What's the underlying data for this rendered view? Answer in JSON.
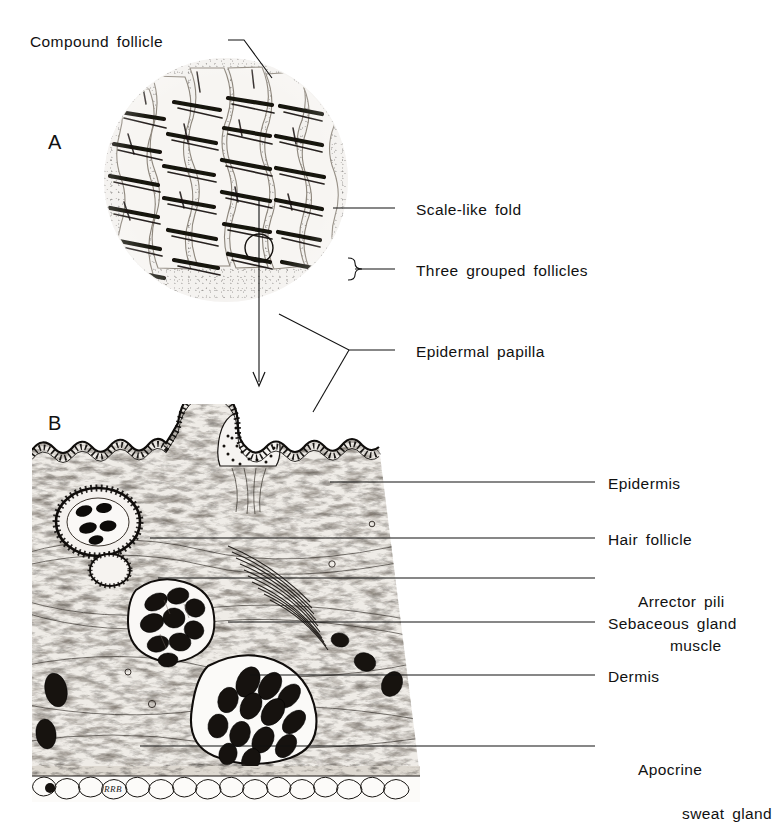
{
  "figure": {
    "panels": [
      {
        "id": "A",
        "letter": "A",
        "caption": "Surface view of haired skin showing scale-like folds and compound follicles"
      },
      {
        "id": "B",
        "letter": "B",
        "caption": "Vertical histologic section of haired skin"
      }
    ]
  },
  "labels": {
    "compound_follicle": "Compound follicle",
    "scale_like_fold": "Scale-like fold",
    "three_grouped_follicles": "Three grouped follicles",
    "epidermal_papilla": "Epidermal papilla",
    "epidermis": "Epidermis",
    "hair_follicle": "Hair follicle",
    "arrector_pili_line1": "Arrector pili",
    "arrector_pili_line2": "muscle",
    "sebaceous_gland": "Sebaceous gland",
    "dermis": "Dermis",
    "apocrine_line1": "Apocrine",
    "apocrine_line2": "sweat gland"
  },
  "signature": "RRB",
  "colors": {
    "ink": "#111111",
    "paper": "#ffffff",
    "tissue_light": "#f2efeb",
    "tissue_mid": "#b9b2a8",
    "tissue_dark": "#2a2622"
  }
}
